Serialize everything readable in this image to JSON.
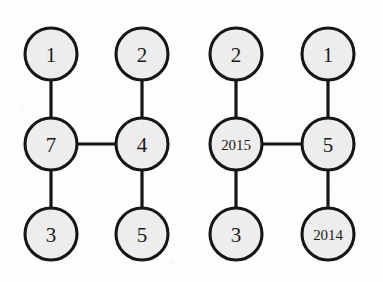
{
  "figure": {
    "type": "graph-pair-diagram",
    "background_color": "#fdfdfd",
    "node_fill": "#ededed",
    "node_stroke": "#161616",
    "edge_color": "#151515",
    "label_color": "#1b1b1b",
    "node_radius": 26,
    "edge_width": 3.2,
    "width": 383,
    "height": 282
  },
  "graphs": [
    {
      "name": "left-graph",
      "nodes": [
        {
          "id": "L-top-left",
          "label": "1",
          "cx": 51,
          "cy": 54,
          "size": "normal"
        },
        {
          "id": "L-top-right",
          "label": "2",
          "cx": 142,
          "cy": 54,
          "size": "normal"
        },
        {
          "id": "L-mid-left",
          "label": "7",
          "cx": 51,
          "cy": 144,
          "size": "normal"
        },
        {
          "id": "L-mid-right",
          "label": "4",
          "cx": 142,
          "cy": 144,
          "size": "normal"
        },
        {
          "id": "L-bot-left",
          "label": "3",
          "cx": 51,
          "cy": 234,
          "size": "normal"
        },
        {
          "id": "L-bot-right",
          "label": "5",
          "cx": 142,
          "cy": 234,
          "size": "normal"
        }
      ],
      "edges": [
        {
          "id": "L-e1",
          "from": "L-top-left",
          "to": "L-mid-left",
          "x1": 51,
          "y1": 80,
          "x2": 51,
          "y2": 118
        },
        {
          "id": "L-e2",
          "from": "L-top-right",
          "to": "L-mid-right",
          "x1": 142,
          "y1": 80,
          "x2": 142,
          "y2": 118
        },
        {
          "id": "L-e3",
          "from": "L-mid-left",
          "to": "L-mid-right",
          "x1": 77,
          "y1": 144,
          "x2": 116,
          "y2": 144
        },
        {
          "id": "L-e4",
          "from": "L-mid-left",
          "to": "L-bot-left",
          "x1": 51,
          "y1": 170,
          "x2": 51,
          "y2": 208
        },
        {
          "id": "L-e5",
          "from": "L-mid-right",
          "to": "L-bot-right",
          "x1": 142,
          "y1": 170,
          "x2": 142,
          "y2": 208
        }
      ]
    },
    {
      "name": "right-graph",
      "nodes": [
        {
          "id": "R-top-left",
          "label": "2",
          "cx": 236,
          "cy": 54,
          "size": "normal"
        },
        {
          "id": "R-top-right",
          "label": "1",
          "cx": 328,
          "cy": 54,
          "size": "normal"
        },
        {
          "id": "R-mid-left",
          "label": "2015",
          "cx": 236,
          "cy": 144,
          "size": "small"
        },
        {
          "id": "R-mid-right",
          "label": "5",
          "cx": 328,
          "cy": 144,
          "size": "normal"
        },
        {
          "id": "R-bot-left",
          "label": "3",
          "cx": 236,
          "cy": 234,
          "size": "normal"
        },
        {
          "id": "R-bot-right",
          "label": "2014",
          "cx": 328,
          "cy": 234,
          "size": "small"
        }
      ],
      "edges": [
        {
          "id": "R-e1",
          "from": "R-top-left",
          "to": "R-mid-left",
          "x1": 236,
          "y1": 80,
          "x2": 236,
          "y2": 118
        },
        {
          "id": "R-e2",
          "from": "R-top-right",
          "to": "R-mid-right",
          "x1": 328,
          "y1": 80,
          "x2": 328,
          "y2": 118
        },
        {
          "id": "R-e3",
          "from": "R-mid-left",
          "to": "R-mid-right",
          "x1": 262,
          "y1": 144,
          "x2": 302,
          "y2": 144
        },
        {
          "id": "R-e4",
          "from": "R-mid-left",
          "to": "R-bot-left",
          "x1": 236,
          "y1": 170,
          "x2": 236,
          "y2": 208
        },
        {
          "id": "R-e5",
          "from": "R-mid-right",
          "to": "R-bot-right",
          "x1": 328,
          "y1": 170,
          "x2": 328,
          "y2": 208
        }
      ]
    }
  ]
}
